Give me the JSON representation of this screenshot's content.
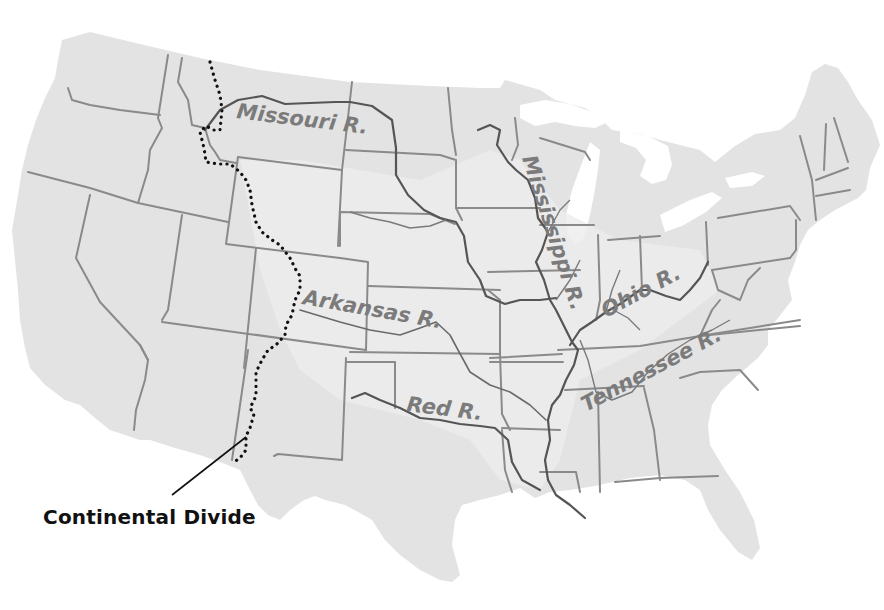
{
  "map": {
    "title": "Major Rivers of the United States",
    "region": "Contiguous United States",
    "colors": {
      "land": "#e3e3e3",
      "state_border": "#8a8a8a",
      "river": "#555555",
      "river_label": "#7b7b7b",
      "divide": "#111111",
      "background": "#ffffff"
    },
    "rivers": [
      {
        "id": "missouri",
        "label": "Missouri R."
      },
      {
        "id": "mississippi",
        "label": "Mississippi R."
      },
      {
        "id": "ohio",
        "label": "Ohio R."
      },
      {
        "id": "arkansas",
        "label": "Arkansas R."
      },
      {
        "id": "red",
        "label": "Red R."
      },
      {
        "id": "tennessee",
        "label": "Tennessee R."
      }
    ],
    "features": [
      {
        "id": "continental-divide",
        "label": "Continental Divide",
        "style": "dotted line"
      }
    ],
    "caption": "Continental Divide"
  }
}
